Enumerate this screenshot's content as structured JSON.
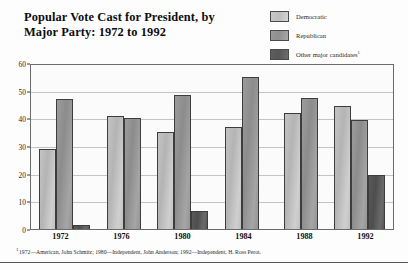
{
  "title": {
    "line1": "Popular Vote Cast for President, by",
    "line2": "Major Party: 1972 to 1992"
  },
  "legend": {
    "items": [
      {
        "label": "Democratic",
        "color": "#c2c2c2",
        "marker": ""
      },
      {
        "label": "Republican",
        "color": "#989898",
        "marker": ""
      },
      {
        "label": "Other major candidates",
        "color": "#5a5a5a",
        "marker": "1"
      }
    ]
  },
  "footnote": {
    "marker": "1",
    "text": "1972—American, John Schmitz; 1980—Independent, John Anderson; 1992—Independent, H. Ross Perot."
  },
  "chart_data": {
    "type": "bar",
    "title": "Popular Vote Cast for President, by Major Party: 1972 to 1992",
    "xlabel": "",
    "ylabel": "",
    "categories": [
      "1972",
      "1976",
      "1980",
      "1984",
      "1988",
      "1992"
    ],
    "series": [
      {
        "name": "Democratic",
        "color": "#c2c2c2",
        "values": [
          29,
          41,
          35,
          37,
          42,
          44.5
        ]
      },
      {
        "name": "Republican",
        "color": "#989898",
        "values": [
          47,
          40,
          48.5,
          55,
          47.5,
          39.5
        ]
      },
      {
        "name": "Other major candidates",
        "color": "#5a5a5a",
        "values": [
          1.4,
          0,
          6.6,
          0,
          0,
          19.5
        ]
      }
    ],
    "ylim": [
      0,
      60
    ],
    "yticks": [
      0,
      10,
      20,
      30,
      40,
      50,
      60
    ],
    "ytick_labels": [
      "0",
      "10",
      "20",
      "30",
      "40",
      "50",
      "60"
    ],
    "grid": true,
    "legend_position": "top-right"
  }
}
